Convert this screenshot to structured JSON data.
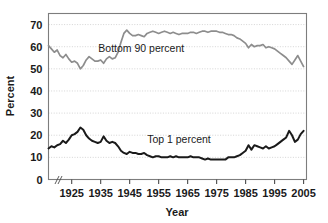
{
  "chart_data": {
    "type": "line",
    "title": "",
    "xlabel": "Year",
    "ylabel": "Percent",
    "xlim": [
      1917,
      2006
    ],
    "ylim": [
      0,
      75
    ],
    "grid": true,
    "legend_position": "inline-annotation",
    "y_ticks": [
      0,
      10,
      20,
      30,
      40,
      50,
      60,
      70
    ],
    "y_tick_labels": [
      "0",
      "10",
      "20",
      "30",
      "40",
      "50",
      "60",
      "70"
    ],
    "x_ticks": [
      1925,
      1935,
      1945,
      1955,
      1965,
      1975,
      1985,
      1995,
      2005
    ],
    "x_tick_labels": [
      "1925",
      "1935",
      "1945",
      "1955",
      "1965",
      "1975",
      "1985",
      "1995",
      "2005"
    ],
    "axis_break": true,
    "series": [
      {
        "name": "Bottom 90 percent",
        "color": "#8d8d8d",
        "label_x": 1949,
        "label_y": 57.5,
        "x": [
          1917,
          1918,
          1919,
          1920,
          1921,
          1922,
          1923,
          1924,
          1925,
          1926,
          1927,
          1928,
          1929,
          1930,
          1931,
          1932,
          1933,
          1934,
          1935,
          1936,
          1937,
          1938,
          1939,
          1940,
          1941,
          1942,
          1943,
          1944,
          1945,
          1946,
          1947,
          1948,
          1949,
          1950,
          1951,
          1952,
          1953,
          1954,
          1955,
          1956,
          1957,
          1958,
          1959,
          1960,
          1961,
          1962,
          1963,
          1964,
          1965,
          1966,
          1967,
          1968,
          1969,
          1970,
          1971,
          1972,
          1973,
          1974,
          1975,
          1976,
          1977,
          1978,
          1979,
          1980,
          1981,
          1982,
          1983,
          1984,
          1985,
          1986,
          1987,
          1988,
          1989,
          1990,
          1991,
          1992,
          1993,
          1994,
          1995,
          1996,
          1997,
          1998,
          1999,
          2000,
          2001,
          2002,
          2003,
          2004,
          2005
        ],
        "y": [
          60.5,
          59.0,
          57.5,
          58.5,
          56.0,
          55.0,
          56.5,
          54.5,
          53.0,
          53.5,
          52.5,
          50.0,
          51.5,
          54.0,
          55.5,
          54.5,
          53.5,
          53.5,
          54.0,
          52.5,
          54.5,
          55.5,
          54.5,
          55.0,
          57.5,
          62.0,
          66.0,
          67.5,
          66.0,
          65.0,
          65.0,
          65.5,
          65.0,
          64.5,
          66.0,
          66.5,
          67.0,
          66.5,
          66.0,
          66.5,
          67.0,
          66.5,
          66.0,
          66.5,
          66.0,
          65.5,
          66.0,
          66.0,
          66.0,
          66.5,
          66.5,
          66.0,
          66.5,
          67.0,
          67.0,
          66.5,
          67.0,
          67.0,
          67.0,
          66.5,
          66.5,
          66.0,
          65.5,
          65.5,
          65.0,
          64.0,
          63.5,
          62.5,
          61.5,
          59.5,
          61.0,
          60.0,
          60.5,
          60.5,
          61.0,
          59.5,
          60.0,
          59.5,
          59.0,
          58.0,
          57.0,
          56.0,
          55.0,
          53.5,
          52.0,
          54.0,
          56.0,
          53.5,
          51.0
        ]
      },
      {
        "name": "Top 1 percent",
        "color": "#1a1a1a",
        "label_x": 1962,
        "label_y": 16.5,
        "x": [
          1917,
          1918,
          1919,
          1920,
          1921,
          1922,
          1923,
          1924,
          1925,
          1926,
          1927,
          1928,
          1929,
          1930,
          1931,
          1932,
          1933,
          1934,
          1935,
          1936,
          1937,
          1938,
          1939,
          1940,
          1941,
          1942,
          1943,
          1944,
          1945,
          1946,
          1947,
          1948,
          1949,
          1950,
          1951,
          1952,
          1953,
          1954,
          1955,
          1956,
          1957,
          1958,
          1959,
          1960,
          1961,
          1962,
          1963,
          1964,
          1965,
          1966,
          1967,
          1968,
          1969,
          1970,
          1971,
          1972,
          1973,
          1974,
          1975,
          1976,
          1977,
          1978,
          1979,
          1980,
          1981,
          1982,
          1983,
          1984,
          1985,
          1986,
          1987,
          1988,
          1989,
          1990,
          1991,
          1992,
          1993,
          1994,
          1995,
          1996,
          1997,
          1998,
          1999,
          2000,
          2001,
          2002,
          2003,
          2004,
          2005
        ],
        "y": [
          14.0,
          15.0,
          14.5,
          15.5,
          16.0,
          17.5,
          16.5,
          18.0,
          20.0,
          20.5,
          21.5,
          23.5,
          22.5,
          20.0,
          18.5,
          17.5,
          17.0,
          16.5,
          17.0,
          19.5,
          17.5,
          16.5,
          17.0,
          16.5,
          15.0,
          13.0,
          12.0,
          11.5,
          12.5,
          12.0,
          12.0,
          11.5,
          11.5,
          12.0,
          11.0,
          10.5,
          10.0,
          10.5,
          10.5,
          10.0,
          10.0,
          10.0,
          10.5,
          10.0,
          10.5,
          10.0,
          10.0,
          10.0,
          10.0,
          10.5,
          10.0,
          10.0,
          10.0,
          9.5,
          9.0,
          9.5,
          9.0,
          9.0,
          9.0,
          9.0,
          9.0,
          9.0,
          10.0,
          10.0,
          10.0,
          10.5,
          11.0,
          12.0,
          13.0,
          15.5,
          13.5,
          15.5,
          15.0,
          14.5,
          14.0,
          15.0,
          14.0,
          14.5,
          15.0,
          16.0,
          17.0,
          18.0,
          19.0,
          22.0,
          20.0,
          17.0,
          18.0,
          20.5,
          22.0
        ]
      }
    ]
  }
}
